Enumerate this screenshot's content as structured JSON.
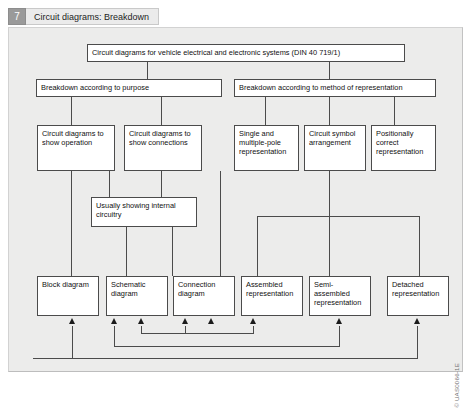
{
  "header": {
    "number": "7",
    "title": "Circuit diagrams: Breakdown"
  },
  "diagram": {
    "root": "Circuit diagrams for vehicle electrical and electronic systems (DIN 40 719/1)",
    "level2": [
      "Breakdown according to purpose",
      "Breakdown according to method of representation"
    ],
    "level3": [
      "Circuit diagrams to show operation",
      "Circuit diagrams to show connections",
      "Single and multiple-pole representation",
      "Circuit symbol arrangement",
      "Positionally correct representation"
    ],
    "note": "Usually showing internal circuitry",
    "level4": [
      "Block diagram",
      "Schematic diagram",
      "Connection diagram",
      "Assembled representation",
      "Semi-assembled representation",
      "Detached representation"
    ]
  },
  "credit": "© UAS0066-1E"
}
